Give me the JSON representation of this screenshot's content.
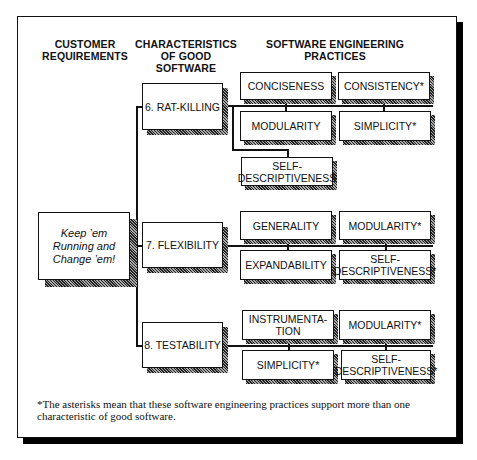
{
  "headers": {
    "customer": [
      "CUSTOMER",
      "REQUIREMENTS"
    ],
    "characteristics": [
      "CHARACTERISTICS",
      "OF GOOD SOFTWARE"
    ],
    "practices": [
      "SOFTWARE ENGINEERING",
      "PRACTICES"
    ]
  },
  "requirement": [
    "Keep ’em",
    "Running and",
    "Change ’em!"
  ],
  "characteristics": [
    {
      "label": "6.  RAT-KILLING",
      "practices": [
        "CONCISENESS",
        "CONSISTENCY*",
        "MODULARITY",
        "SIMPLICITY*",
        "SELF-|DESCRIPTIVENESS"
      ]
    },
    {
      "label": "7.  FLEXIBILITY",
      "practices": [
        "GENERALITY",
        "MODULARITY*",
        "EXPANDABILITY",
        "SELF-|DESCRIPTIVENESS*"
      ]
    },
    {
      "label": "8.  TESTABILITY",
      "practices": [
        "INSTRUMENTA-|TION",
        "MODULARITY*",
        "SIMPLICITY*",
        "SELF-|DESCRIPTIVENESS*"
      ]
    }
  ],
  "footnote": "*The asterisks mean that these software engineering practices support more than one characteristic of good software."
}
